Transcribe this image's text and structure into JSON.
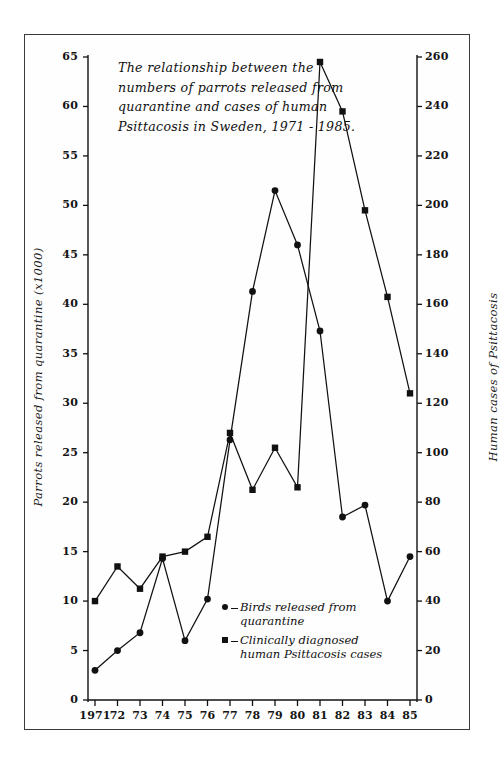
{
  "chart_data": {
    "type": "line",
    "title": "The relationship between the numbers of parrots released from quarantine and cases of human Psittacosis in Sweden, 1971 - 1985.",
    "title_lines": "The relationship between the\nnumbers of parrots released\nfrom quarantine and cases of\nhuman Psittacosis in Sweden,\n1971 - 1985.",
    "xlabel": "",
    "ylabel": "Parrots released from quarantine (x1000)",
    "ylabel_right": "Human cases of Psittacosis",
    "x": [
      "1971",
      "1972",
      "1973",
      "1974",
      "1975",
      "1976",
      "1977",
      "1978",
      "1979",
      "1980",
      "1981",
      "1982",
      "1983",
      "1984",
      "1985"
    ],
    "categories": [
      "1971",
      "72",
      "73",
      "74",
      "75",
      "76",
      "77",
      "78",
      "79",
      "80",
      "81",
      "82",
      "83",
      "84",
      "85"
    ],
    "xtick_labels": [
      "1971",
      "72",
      "73",
      "74",
      "75",
      "76",
      "77",
      "78",
      "79",
      "80",
      "81",
      "82",
      "83",
      "84",
      "85"
    ],
    "ylim": [
      0,
      65
    ],
    "ylim_right": [
      0,
      260
    ],
    "yticks": [
      0,
      5,
      10,
      15,
      20,
      25,
      30,
      35,
      40,
      45,
      50,
      55,
      60,
      65
    ],
    "yticks_right": [
      0,
      20,
      40,
      60,
      80,
      100,
      120,
      140,
      160,
      180,
      200,
      220,
      240,
      260
    ],
    "grid": false,
    "legend_position": "inside-lower-right",
    "series": [
      {
        "name": "Birds released from quarantine",
        "legend_label": "Birds released from\nquarantine",
        "marker": "circle",
        "axis": "left",
        "color": "#111111",
        "values": [
          3,
          5,
          6.8,
          14.3,
          6,
          10.2,
          26.3,
          41.3,
          51.5,
          46,
          37.3,
          18.5,
          19.7,
          10,
          14.5
        ]
      },
      {
        "name": "Clinically diagnosed human Psittacosis cases",
        "legend_label": "Clinically diagnosed\nhuman Psittacosis cases",
        "marker": "square",
        "axis": "right",
        "color": "#111111",
        "values": [
          40,
          54,
          45,
          58,
          60,
          66,
          108,
          85,
          102,
          86,
          258,
          238,
          198,
          163,
          124
        ]
      }
    ]
  },
  "colors": {
    "ink": "#111111",
    "frame": "#3a3a3a",
    "background": "#ffffff"
  }
}
